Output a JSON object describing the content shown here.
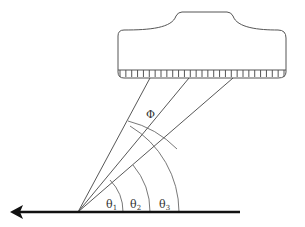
{
  "diagram": {
    "type": "ultrasound transducer beam-steering angle diagram",
    "colors": {
      "stroke": "#444444",
      "arrow": "#111111",
      "background": "#ffffff"
    },
    "transducer": {
      "label": "transducer",
      "element_count": 28
    },
    "beam_angle_label": "Φ",
    "angle_labels": [
      {
        "symbol": "θ",
        "subscript": "1"
      },
      {
        "symbol": "θ",
        "subscript": "2"
      },
      {
        "symbol": "θ",
        "subscript": "3"
      }
    ],
    "arrow": {
      "direction": "left"
    }
  }
}
